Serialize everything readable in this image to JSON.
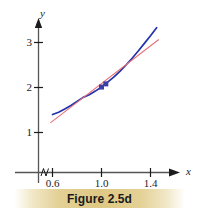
{
  "figure": {
    "caption": "Figure 2.5d",
    "background_color": "#ffffff",
    "caption_band_color": "#dec884"
  },
  "chart_data": {
    "type": "line",
    "title": "Figure 2.5d",
    "xlabel": "x",
    "ylabel": "y",
    "xlim": [
      0.5,
      1.52
    ],
    "ylim": [
      0.0,
      3.45
    ],
    "xticks": [
      0.6,
      1.0,
      1.4
    ],
    "xticklabels": [
      "0.6",
      "1.0",
      "1.4"
    ],
    "yticks": [
      1,
      2,
      3
    ],
    "yticklabels": [
      "1",
      "2",
      "3"
    ],
    "grid": false,
    "legend": null,
    "axis_break": {
      "axis": "x",
      "symbol": "squiggle",
      "position": 0.535
    },
    "series": [
      {
        "name": "curve",
        "color": "#2233aa",
        "style": "solid",
        "width": 1.7,
        "points": [
          {
            "x": 0.6,
            "y": 1.4
          },
          {
            "x": 0.65,
            "y": 1.45
          },
          {
            "x": 0.7,
            "y": 1.52
          },
          {
            "x": 0.75,
            "y": 1.6
          },
          {
            "x": 0.8,
            "y": 1.69
          },
          {
            "x": 0.85,
            "y": 1.78
          },
          {
            "x": 0.9,
            "y": 1.84
          },
          {
            "x": 0.95,
            "y": 1.92
          },
          {
            "x": 1.0,
            "y": 2.01
          },
          {
            "x": 1.05,
            "y": 2.12
          },
          {
            "x": 1.1,
            "y": 2.23
          },
          {
            "x": 1.15,
            "y": 2.36
          },
          {
            "x": 1.2,
            "y": 2.5
          },
          {
            "x": 1.25,
            "y": 2.65
          },
          {
            "x": 1.3,
            "y": 2.81
          },
          {
            "x": 1.35,
            "y": 2.98
          },
          {
            "x": 1.4,
            "y": 3.15
          },
          {
            "x": 1.45,
            "y": 3.33
          }
        ]
      },
      {
        "name": "secant-line",
        "color": "#e8707a",
        "style": "solid",
        "width": 1.1,
        "points": [
          {
            "x": 0.585,
            "y": 1.22
          },
          {
            "x": 1.465,
            "y": 3.06
          }
        ]
      }
    ],
    "markers": [
      {
        "name": "point-a",
        "x": 1.0,
        "y": 2.01,
        "color": "#3b3fa5",
        "shape": "square",
        "size": 5
      },
      {
        "name": "point-b",
        "x": 1.035,
        "y": 2.08,
        "color": "#3b3fa5",
        "shape": "square",
        "size": 5
      }
    ]
  }
}
